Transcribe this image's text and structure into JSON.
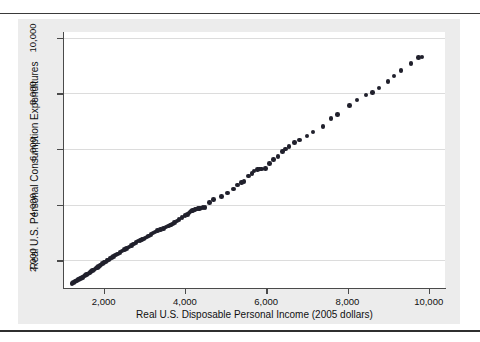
{
  "figure": {
    "panel_color": "#ececec",
    "plot_bg": "#ffffff",
    "rule_color": "#3a3a3a",
    "marker_color": "#20202c",
    "grid_color": "#dcdcdc",
    "axis_color": "#4a4a4a"
  },
  "chart_data": {
    "type": "scatter",
    "title": "",
    "xlabel": "Real U.S. Disposable Personal Income (2005 dollars)",
    "ylabel": "Real U.S. Personal Consumption Expenditures",
    "xlim": [
      1000,
      10400
    ],
    "ylim": [
      1000,
      10200
    ],
    "xticks": [
      2000,
      4000,
      6000,
      8000,
      10000
    ],
    "xticklabels": [
      "2,000",
      "4,000",
      "6,000",
      "8,000",
      "10,000"
    ],
    "yticks": [
      2000,
      4000,
      6000,
      8000,
      10000
    ],
    "yticklabels": [
      "2,000",
      "4,000",
      "6,000",
      "8,000",
      "10,000"
    ],
    "grid": "horizontal",
    "legend": "none",
    "marker": "filled-circle",
    "series": [
      {
        "name": "Consumption vs Disposable Income",
        "points": [
          [
            1222,
            1161
          ],
          [
            1260,
            1201
          ],
          [
            1295,
            1228
          ],
          [
            1318,
            1254
          ],
          [
            1346,
            1278
          ],
          [
            1378,
            1298
          ],
          [
            1399,
            1318
          ],
          [
            1428,
            1338
          ],
          [
            1455,
            1363
          ],
          [
            1475,
            1380
          ],
          [
            1497,
            1402
          ],
          [
            1523,
            1430
          ],
          [
            1553,
            1460
          ],
          [
            1580,
            1485
          ],
          [
            1610,
            1510
          ],
          [
            1640,
            1540
          ],
          [
            1662,
            1560
          ],
          [
            1692,
            1589
          ],
          [
            1724,
            1620
          ],
          [
            1758,
            1655
          ],
          [
            1790,
            1690
          ],
          [
            1817,
            1718
          ],
          [
            1845,
            1745
          ],
          [
            1873,
            1770
          ],
          [
            1905,
            1800
          ],
          [
            1940,
            1835
          ],
          [
            1978,
            1872
          ],
          [
            2012,
            1908
          ],
          [
            2050,
            1942
          ],
          [
            2085,
            1980
          ],
          [
            2122,
            2015
          ],
          [
            2160,
            2055
          ],
          [
            2200,
            2094
          ],
          [
            2240,
            2130
          ],
          [
            2290,
            2180
          ],
          [
            2346,
            2230
          ],
          [
            2400,
            2280
          ],
          [
            2455,
            2332
          ],
          [
            2511,
            2380
          ],
          [
            2562,
            2425
          ],
          [
            2620,
            2480
          ],
          [
            2680,
            2535
          ],
          [
            2736,
            2588
          ],
          [
            2800,
            2640
          ],
          [
            2850,
            2690
          ],
          [
            2890,
            2710
          ],
          [
            2920,
            2728
          ],
          [
            2946,
            2740
          ],
          [
            2980,
            2760
          ],
          [
            3020,
            2790
          ],
          [
            3065,
            2830
          ],
          [
            3110,
            2875
          ],
          [
            3160,
            2925
          ],
          [
            3210,
            2980
          ],
          [
            3270,
            3020
          ],
          [
            3330,
            3060
          ],
          [
            3400,
            3105
          ],
          [
            3470,
            3145
          ],
          [
            3540,
            3190
          ],
          [
            3600,
            3230
          ],
          [
            3640,
            3260
          ],
          [
            3660,
            3270
          ],
          [
            3690,
            3300
          ],
          [
            3740,
            3350
          ],
          [
            3800,
            3405
          ],
          [
            3860,
            3470
          ],
          [
            3930,
            3535
          ],
          [
            4000,
            3600
          ],
          [
            4060,
            3650
          ],
          [
            4100,
            3700
          ],
          [
            4130,
            3740
          ],
          [
            4160,
            3770
          ],
          [
            4190,
            3790
          ],
          [
            4220,
            3805
          ],
          [
            4250,
            3820
          ],
          [
            4280,
            3835
          ],
          [
            4320,
            3850
          ],
          [
            4360,
            3860
          ],
          [
            4400,
            3875
          ],
          [
            4450,
            3890
          ],
          [
            4500,
            3900
          ],
          [
            4600,
            4080
          ],
          [
            4700,
            4180
          ],
          [
            4900,
            4290
          ],
          [
            5050,
            4420
          ],
          [
            5200,
            4550
          ],
          [
            5300,
            4700
          ],
          [
            5390,
            4790
          ],
          [
            5450,
            4830
          ],
          [
            5560,
            5020
          ],
          [
            5650,
            5120
          ],
          [
            5700,
            5210
          ],
          [
            5780,
            5250
          ],
          [
            5840,
            5270
          ],
          [
            5880,
            5280
          ],
          [
            5980,
            5290
          ],
          [
            6080,
            5480
          ],
          [
            6180,
            5610
          ],
          [
            6290,
            5720
          ],
          [
            6400,
            5900
          ],
          [
            6480,
            6000
          ],
          [
            6560,
            6080
          ],
          [
            6700,
            6220
          ],
          [
            6820,
            6320
          ],
          [
            7000,
            6460
          ],
          [
            7150,
            6600
          ],
          [
            7400,
            6800
          ],
          [
            7600,
            7100
          ],
          [
            7750,
            7230
          ],
          [
            8050,
            7550
          ],
          [
            8230,
            7750
          ],
          [
            8450,
            7930
          ],
          [
            8620,
            8020
          ],
          [
            8780,
            8180
          ],
          [
            9000,
            8420
          ],
          [
            9150,
            8620
          ],
          [
            9320,
            8820
          ],
          [
            9560,
            9060
          ],
          [
            9750,
            9280
          ],
          [
            9830,
            9310
          ]
        ]
      }
    ]
  }
}
